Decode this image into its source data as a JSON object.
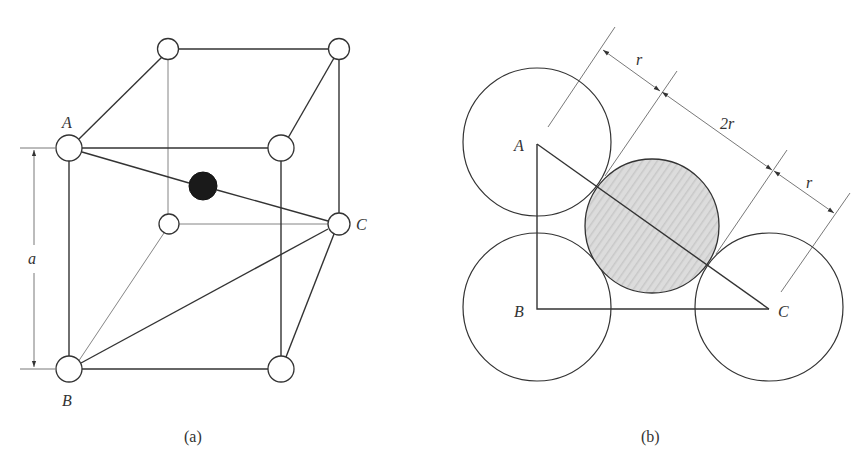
{
  "figure": {
    "panel_a": {
      "caption": "(a)",
      "labels": {
        "A": "A",
        "B": "B",
        "C": "C",
        "dimension": "a"
      },
      "description": "Cubic unit cell with corner atoms; dark interstitial atom on diagonal A–C"
    },
    "panel_b": {
      "caption": "(b)",
      "labels": {
        "A": "A",
        "B": "B",
        "C": "C",
        "r_left": "r",
        "two_r": "2r",
        "r_right": "r"
      },
      "description": "Cross-section: three large atoms at A, B, C with shaded interstitial sphere tangent along A–C"
    }
  },
  "colors": {
    "line": "#333333",
    "interstitial_dark": "#1a1a1a",
    "shaded_fill": "#d9d9d9",
    "background": "#ffffff"
  }
}
